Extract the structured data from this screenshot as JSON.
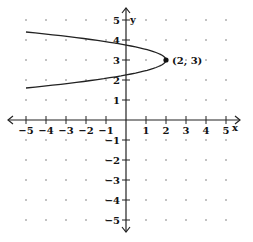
{
  "chart_data": {
    "type": "line",
    "title": "",
    "xlabel": "x",
    "ylabel": "y",
    "xlim": [
      -5,
      5
    ],
    "ylim": [
      -5,
      5
    ],
    "grid": "dots",
    "x_ticks": [
      -5,
      -4,
      -3,
      -2,
      -1,
      1,
      2,
      3,
      4,
      5
    ],
    "y_ticks": [
      -5,
      -4,
      -3,
      -2,
      -1,
      1,
      2,
      3,
      4,
      5
    ],
    "series": [
      {
        "name": "parabola opening left",
        "equation_hint": "x = 2 - (y - 3)^2 * 3.57",
        "points": [
          {
            "x": -5,
            "y": 4.4
          },
          {
            "x": 0,
            "y": 3.75
          },
          {
            "x": 2,
            "y": 3
          },
          {
            "x": 0,
            "y": 2.25
          },
          {
            "x": -5,
            "y": 1.6
          }
        ]
      }
    ],
    "annotations": [
      {
        "label": "(2, 3)",
        "x": 2,
        "y": 3,
        "marker": "filled-dot"
      }
    ]
  },
  "labels": {
    "x_axis": "x",
    "y_axis": "y",
    "vertex": "(2, 3)"
  }
}
